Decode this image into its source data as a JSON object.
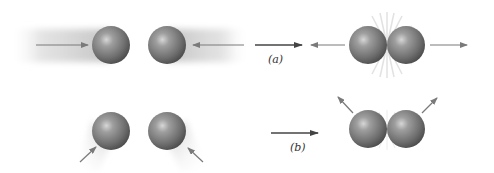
{
  "figure": {
    "colors": {
      "ball": "#8a8a8a",
      "ball_dark": "#4a4a4a",
      "ball_highlight": "#d8d8d8",
      "arrow": "#7a7a7a",
      "shadow": "#cfcfcf",
      "starburst": "#e4e4e4"
    },
    "panels": [
      {
        "id": "a",
        "label": "(a)",
        "before": "Two balls moving directly toward each other along a line",
        "after": "Balls touch then move apart along the same line"
      },
      {
        "id": "b",
        "label": "(b)",
        "before": "Two balls approaching each other at an angle from below",
        "after": "Balls touch then move apart diagonally upward"
      }
    ]
  }
}
